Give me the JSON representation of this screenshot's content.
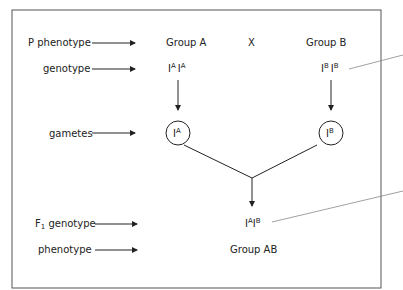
{
  "rows": {
    "p_phenotype": "P phenotype",
    "genotype": "genotype",
    "gametes": "gametes",
    "f1_genotype_main": "F",
    "f1_genotype_sub": "1",
    "f1_genotype_rest": " genotype",
    "phenotype": "phenotype"
  },
  "parents": {
    "a": {
      "group": "Group A",
      "allele_base": "I",
      "allele_sup": "A"
    },
    "cross": "X",
    "b": {
      "group": "Group B",
      "allele_base": "I",
      "allele_sup": "B"
    }
  },
  "offspring": {
    "genotype_base": "I",
    "sup1": "A",
    "sup2": "B",
    "group": "Group AB"
  },
  "colors": {
    "line": "#222222",
    "frame": "#555555",
    "pointer": "#888888"
  }
}
